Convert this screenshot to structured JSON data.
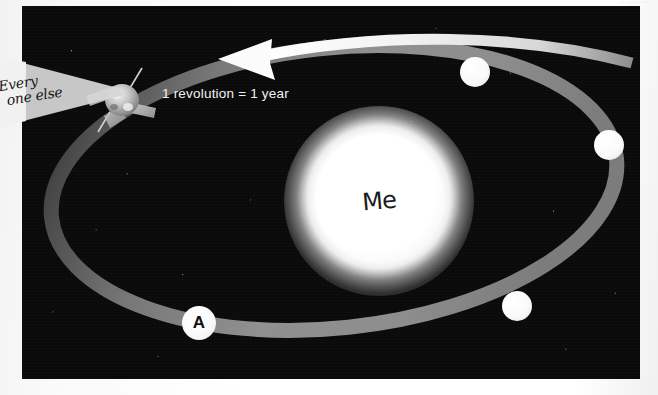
{
  "page": {
    "header_scrap": "... ... ... ...",
    "background_color": "#ffffff"
  },
  "photo": {
    "background_color": "#0a0a0a",
    "alt_name": "space-scene-sun-and-orbit"
  },
  "sun": {
    "label": "Me",
    "label_style": "handwritten",
    "color": "#ffffff"
  },
  "caption": {
    "text": "1 revolution = 1 year",
    "color": "#f2f2f2"
  },
  "orbit": {
    "color": "#8a8a8a",
    "arrow_color": "#f0f0f0",
    "direction": "counter-clockwise"
  },
  "planets": [
    {
      "label": "",
      "name": "planet-top"
    },
    {
      "label": "",
      "name": "planet-right"
    },
    {
      "label": "",
      "name": "planet-bottom-right"
    },
    {
      "label": "A",
      "name": "planet-a"
    }
  ],
  "annotation": {
    "line1": "Every",
    "line2": "one else",
    "target": "spacecraft"
  },
  "spacecraft": {
    "name": "spacecraft-icon",
    "color": "#b9b9b9"
  }
}
